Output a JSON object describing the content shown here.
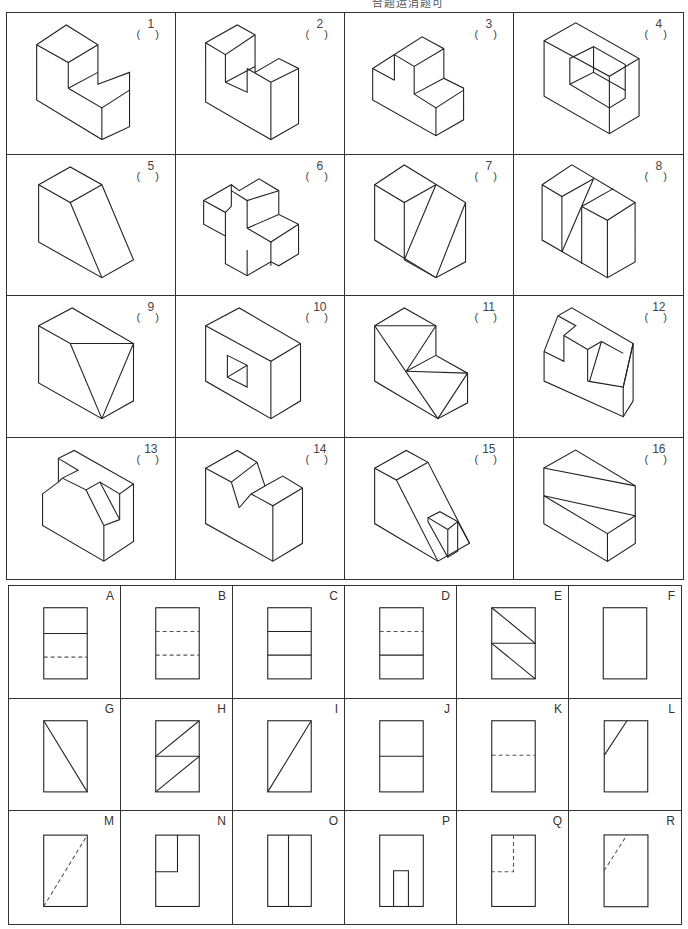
{
  "header": {
    "partial_text": "合题运消题可"
  },
  "pictorials": {
    "items": [
      {
        "id": "1",
        "label": "1",
        "answer": ""
      },
      {
        "id": "2",
        "label": "2",
        "answer": ""
      },
      {
        "id": "3",
        "label": "3",
        "answer": ""
      },
      {
        "id": "4",
        "label": "4",
        "answer": ""
      },
      {
        "id": "5",
        "label": "5",
        "answer": ""
      },
      {
        "id": "6",
        "label": "6",
        "answer": ""
      },
      {
        "id": "7",
        "label": "7",
        "answer": ""
      },
      {
        "id": "8",
        "label": "8",
        "answer": ""
      },
      {
        "id": "9",
        "label": "9",
        "answer": ""
      },
      {
        "id": "10",
        "label": "10",
        "answer": ""
      },
      {
        "id": "11",
        "label": "11",
        "answer": ""
      },
      {
        "id": "12",
        "label": "12",
        "answer": ""
      },
      {
        "id": "13",
        "label": "13",
        "answer": ""
      },
      {
        "id": "14",
        "label": "14",
        "answer": ""
      },
      {
        "id": "15",
        "label": "15",
        "answer": ""
      },
      {
        "id": "16",
        "label": "16",
        "answer": ""
      }
    ],
    "paren_text": "( )"
  },
  "views": {
    "items": [
      {
        "label": "A",
        "lines": [
          "solid-horizontal-upper",
          "hidden-horizontal-lower"
        ]
      },
      {
        "label": "B",
        "lines": [
          "hidden-horizontal-upper",
          "hidden-horizontal-lower"
        ]
      },
      {
        "label": "C",
        "lines": [
          "solid-horizontal-upper",
          "solid-horizontal-lower"
        ]
      },
      {
        "label": "D",
        "lines": [
          "hidden-horizontal-upper",
          "solid-horizontal-lower"
        ]
      },
      {
        "label": "E",
        "lines": [
          "solid-horizontal-middle",
          "solid-diagonal-upper",
          "solid-diagonal-lower"
        ]
      },
      {
        "label": "F",
        "lines": []
      },
      {
        "label": "G",
        "lines": [
          "solid-diagonal-full-topleft-to-bottomright"
        ]
      },
      {
        "label": "H",
        "lines": [
          "solid-horizontal-middle",
          "solid-diagonal-upper-reverse",
          "solid-diagonal-lower-reverse"
        ]
      },
      {
        "label": "I",
        "lines": [
          "solid-diagonal-full-bottomleft-to-topright"
        ]
      },
      {
        "label": "J",
        "lines": [
          "solid-horizontal-middle"
        ]
      },
      {
        "label": "K",
        "lines": [
          "hidden-horizontal-middle"
        ]
      },
      {
        "label": "L",
        "lines": [
          "solid-diagonal-corner-upper-left"
        ]
      },
      {
        "label": "M",
        "lines": [
          "hidden-diagonal-full-bottomleft-to-topright"
        ]
      },
      {
        "label": "N",
        "lines": [
          "solid-notch-upper-left"
        ]
      },
      {
        "label": "O",
        "lines": [
          "solid-vertical-middle"
        ]
      },
      {
        "label": "P",
        "lines": [
          "solid-slot-bottom-center"
        ]
      },
      {
        "label": "Q",
        "lines": [
          "hidden-notch-upper-left"
        ]
      },
      {
        "label": "R",
        "lines": [
          "hidden-diagonal-corner-upper-left"
        ]
      }
    ]
  }
}
